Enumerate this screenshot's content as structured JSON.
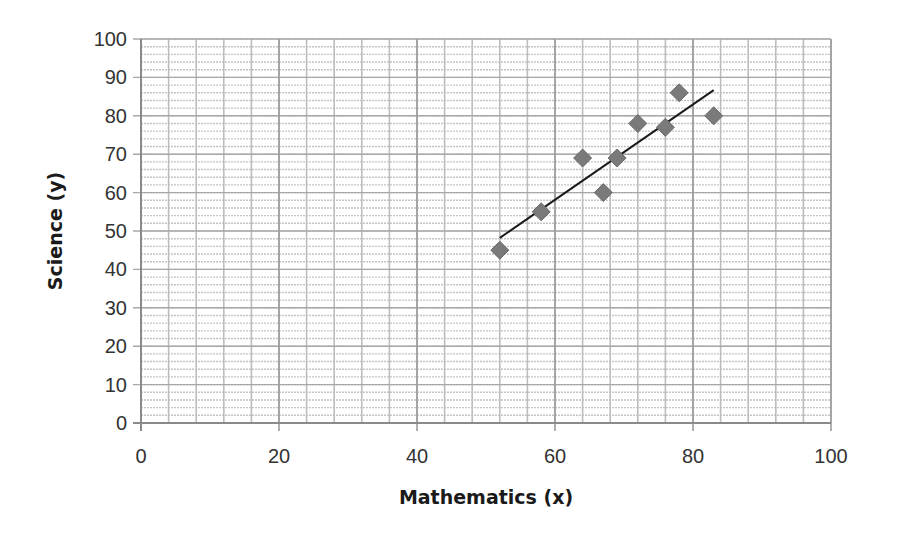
{
  "chart_data": {
    "type": "scatter",
    "title": "",
    "xlabel": "Mathematics (x)",
    "ylabel": "Science (y)",
    "xlim": [
      0,
      100
    ],
    "ylim": [
      0,
      100
    ],
    "x_ticks": [
      0,
      20,
      40,
      60,
      80,
      100
    ],
    "y_ticks": [
      0,
      10,
      20,
      30,
      40,
      50,
      60,
      70,
      80,
      90,
      100
    ],
    "x_minor_step": 4,
    "y_minor_step": 2,
    "grid": true,
    "legend": null,
    "series": [
      {
        "name": "Scores",
        "marker": "diamond",
        "color": "#7a7a7a",
        "points": [
          {
            "x": 52,
            "y": 45
          },
          {
            "x": 58,
            "y": 55
          },
          {
            "x": 64,
            "y": 69
          },
          {
            "x": 67,
            "y": 60
          },
          {
            "x": 69,
            "y": 69
          },
          {
            "x": 72,
            "y": 78
          },
          {
            "x": 76,
            "y": 77
          },
          {
            "x": 78,
            "y": 86
          },
          {
            "x": 83,
            "y": 80
          }
        ]
      }
    ],
    "trendline": {
      "type": "linear",
      "color": "#1a1a1a",
      "start": {
        "x": 52,
        "y": 48.2
      },
      "end": {
        "x": 83,
        "y": 86.7
      }
    }
  },
  "labels": {
    "xlabel": "Mathematics (x)",
    "ylabel": "Science (y)"
  }
}
